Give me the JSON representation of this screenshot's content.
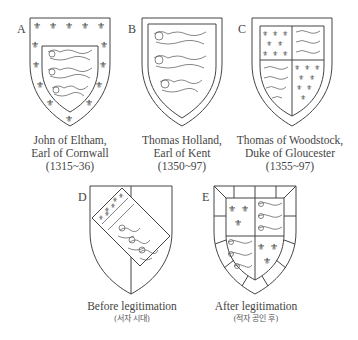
{
  "figure": {
    "shields": [
      {
        "label": "A",
        "caption_lines": [
          "John of Eltham,",
          "Earl of Cornwall",
          "(1315~36)"
        ],
        "design": "three lions within a bordure of fleurs-de-lis"
      },
      {
        "label": "B",
        "caption_lines": [
          "Thomas Holland,",
          "Earl of Kent",
          "(1350~97)"
        ],
        "design": "three lions within a plain bordure"
      },
      {
        "label": "C",
        "caption_lines": [
          "Thomas of Woodstock,",
          "Duke of Gloucester",
          "(1355~97)"
        ],
        "design": "quarterly France and England within a bordure"
      },
      {
        "label": "D",
        "caption_lines": [
          "Before legitimation"
        ],
        "subcaption": "(서자 시대)",
        "design": "per pale with bend of England and France"
      },
      {
        "label": "E",
        "caption_lines": [
          "After legitimation"
        ],
        "subcaption": "(적자 공인 후)",
        "design": "quarterly France and England within a compony bordure"
      }
    ],
    "icons": {
      "fleur": "⚜"
    }
  }
}
